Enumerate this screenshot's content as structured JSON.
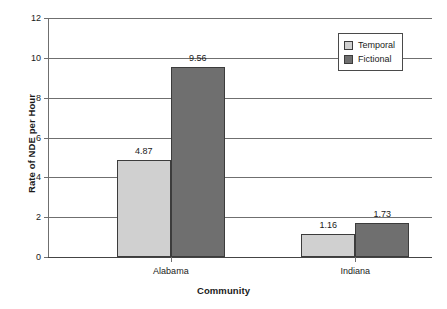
{
  "chart_data": {
    "type": "bar",
    "title": "",
    "xlabel": "Community",
    "ylabel": "Rate of NDE per Hour",
    "categories": [
      "Alabama",
      "Indiana"
    ],
    "series": [
      {
        "name": "Temporal",
        "values": [
          4.87,
          1.16
        ],
        "color": "#d0d0d0"
      },
      {
        "name": "Fictional",
        "values": [
          9.56,
          1.73
        ],
        "color": "#6f6f6f"
      }
    ],
    "value_labels": [
      [
        "4.87",
        "9.56"
      ],
      [
        "1.16",
        "1.73"
      ]
    ],
    "ylim": [
      0,
      12
    ],
    "yticks": [
      0,
      2,
      4,
      6,
      8,
      10,
      12
    ],
    "ytick_labels": [
      "0",
      "2",
      "4",
      "6",
      "8",
      "10",
      "12"
    ],
    "grid": true,
    "legend_position": "top-right",
    "legend_entries": [
      "Temporal",
      "Fictional"
    ]
  },
  "axis": {
    "y_title": "Rate of NDE per Hour",
    "x_title": "Community"
  },
  "legend": {
    "items": [
      {
        "label": "Temporal",
        "swatch": "legend-swatch-temporal"
      },
      {
        "label": "Fictional",
        "swatch": "legend-swatch-fictional"
      }
    ]
  },
  "colors": {
    "temporal": "#d0d0d0",
    "fictional": "#6f6f6f",
    "gridline": "#6f6f6f",
    "text": "#1a1a1a",
    "background": "#ffffff"
  }
}
